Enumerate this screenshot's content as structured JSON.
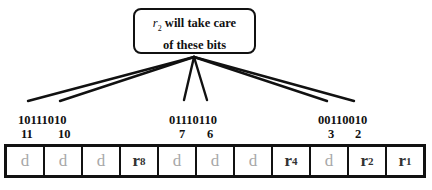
{
  "callout": {
    "prefix_symbol": "r",
    "prefix_sub": "2",
    "line1_rest": " will take care",
    "line2": "of these bits"
  },
  "groups": [
    {
      "bits": "10111010",
      "indices": [
        "11",
        "10"
      ]
    },
    {
      "bits": "01110110",
      "indices": [
        "7",
        "6"
      ]
    },
    {
      "bits": "00110010",
      "indices": [
        "3",
        "2"
      ]
    }
  ],
  "cells": [
    {
      "label": "d",
      "sub": "",
      "type": "data"
    },
    {
      "label": "d",
      "sub": "",
      "type": "data"
    },
    {
      "label": "d",
      "sub": "",
      "type": "data"
    },
    {
      "label": "r",
      "sub": "8",
      "type": "redundant"
    },
    {
      "label": "d",
      "sub": "",
      "type": "data"
    },
    {
      "label": "d",
      "sub": "",
      "type": "data"
    },
    {
      "label": "d",
      "sub": "",
      "type": "data"
    },
    {
      "label": "r",
      "sub": "4",
      "type": "redundant"
    },
    {
      "label": "d",
      "sub": "",
      "type": "data"
    },
    {
      "label": "r",
      "sub": "2",
      "type": "redundant"
    },
    {
      "label": "r",
      "sub": "1",
      "type": "redundant"
    }
  ],
  "colors": {
    "line": "#111111",
    "data_text": "#a8a8a8",
    "redundant_text": "#333333"
  }
}
